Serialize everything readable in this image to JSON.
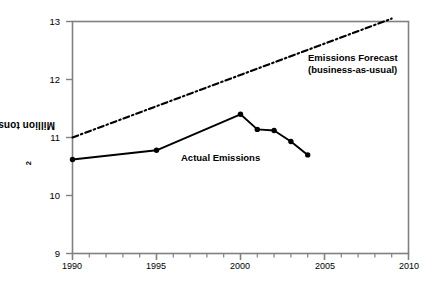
{
  "chart_data": {
    "type": "line",
    "title": "",
    "subtitle": "",
    "xlabel": "",
    "ylabel": "Million tons eCO2",
    "ylabel_main": "Million tons eCO",
    "ylabel_sub": "2",
    "xlim": [
      1990,
      2010
    ],
    "ylim": [
      9,
      13
    ],
    "grid": false,
    "legend_position": "inline-annotations",
    "x_ticks": [
      1990,
      1995,
      2000,
      2005,
      2010
    ],
    "x_tick_labels": [
      "1990",
      "1995",
      "2000",
      "2005",
      "2010"
    ],
    "x_minor_tick_interval": 1,
    "y_ticks": [
      9,
      10,
      11,
      12,
      13
    ],
    "y_tick_labels": [
      "9",
      "10",
      "11",
      "12",
      "13"
    ],
    "series": [
      {
        "name": "Actual Emissions",
        "style": "solid-with-markers",
        "color": "#000000",
        "x": [
          1990,
          1995,
          2000,
          2001,
          2002,
          2003,
          2004
        ],
        "values": [
          10.62,
          10.78,
          11.4,
          11.14,
          11.12,
          10.93,
          10.7
        ]
      },
      {
        "name": "Emissions Forecast (business-as-usual)",
        "style": "dash-dot",
        "color": "#000000",
        "x": [
          1990,
          2009
        ],
        "values": [
          11.0,
          13.05
        ]
      }
    ],
    "annotations": [
      {
        "id": "forecast-label",
        "line1": "Emissions Forecast",
        "line2": "(business-as-usual)",
        "x_px": 308,
        "y_px": 52
      },
      {
        "id": "actual-label",
        "line1": "Actual Emissions",
        "line2": "",
        "x_px": 181,
        "y_px": 152
      }
    ],
    "colors": {
      "axis": "#808080",
      "line": "#000000",
      "text": "#000000",
      "background": "#ffffff"
    }
  }
}
